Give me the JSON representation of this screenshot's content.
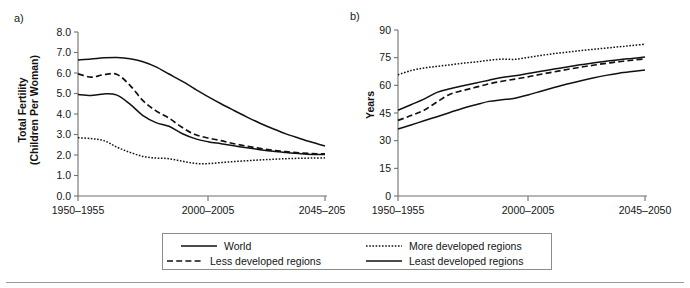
{
  "figure": {
    "background": "#ffffff",
    "line_color": "#111111",
    "axis_color": "#6f6f6f",
    "legend_border_color": "#8c8c8c"
  },
  "panels": {
    "a": {
      "letter": "a)",
      "ylabel_line1": "Total Fertility",
      "ylabel_line2": "(Children Per Woman)"
    },
    "b": {
      "letter": "b)",
      "ylabel": "Years"
    }
  },
  "legend": {
    "position": "below-plots",
    "entries": [
      {
        "label": "World",
        "style": "solid",
        "row": 0,
        "col": 0
      },
      {
        "label": "Less developed regions",
        "style": "dashed",
        "row": 1,
        "col": 0
      },
      {
        "label": "More developed regions",
        "style": "dotted",
        "row": 0,
        "col": 1
      },
      {
        "label": "Least developed regions",
        "style": "solid",
        "row": 1,
        "col": 1
      }
    ]
  },
  "chart_data": [
    {
      "id": "panel-a",
      "type": "line",
      "title": "",
      "panel_letter": "a)",
      "xlabel": "",
      "ylabel": "Total Fertility (Children Per Woman)",
      "ylim": [
        0.0,
        8.0
      ],
      "yticks": [
        0.0,
        1.0,
        2.0,
        3.0,
        4.0,
        5.0,
        6.0,
        7.0,
        8.0
      ],
      "ytick_labels": [
        "0.0",
        "1.0",
        "2.0",
        "3.0",
        "4.0",
        "5.0",
        "6.0",
        "7.0",
        "8.0"
      ],
      "xticks": [
        0,
        10,
        19
      ],
      "xtick_labels": [
        "1950–1955",
        "2000–2005",
        "2045–2050"
      ],
      "x": [
        "1950-1955",
        "1955-1960",
        "1960-1965",
        "1965-1970",
        "1970-1975",
        "1975-1980",
        "1980-1985",
        "1985-1990",
        "1990-1995",
        "1995-2000",
        "2000-2005",
        "2005-2010",
        "2010-2015",
        "2015-2020",
        "2020-2025",
        "2025-2030",
        "2030-2035",
        "2035-2040",
        "2040-2045",
        "2045-2050"
      ],
      "grid": false,
      "legend": "shared",
      "series": [
        {
          "name": "World",
          "style": "solid",
          "values": [
            4.95,
            4.9,
            4.98,
            4.92,
            4.48,
            3.92,
            3.58,
            3.4,
            3.05,
            2.8,
            2.65,
            2.55,
            2.45,
            2.35,
            2.26,
            2.18,
            2.12,
            2.07,
            2.03,
            2.02
          ]
        },
        {
          "name": "Less developed regions",
          "style": "dashed",
          "values": [
            5.96,
            5.8,
            5.92,
            5.93,
            5.4,
            4.65,
            4.15,
            3.8,
            3.35,
            3.0,
            2.83,
            2.7,
            2.55,
            2.43,
            2.32,
            2.23,
            2.16,
            2.1,
            2.07,
            2.05
          ]
        },
        {
          "name": "More developed regions",
          "style": "dotted",
          "values": [
            2.84,
            2.8,
            2.7,
            2.38,
            2.13,
            1.93,
            1.85,
            1.82,
            1.7,
            1.59,
            1.58,
            1.63,
            1.68,
            1.72,
            1.76,
            1.79,
            1.82,
            1.84,
            1.85,
            1.86
          ]
        },
        {
          "name": "Least developed regions",
          "style": "solid",
          "values": [
            6.64,
            6.68,
            6.74,
            6.76,
            6.7,
            6.55,
            6.3,
            5.95,
            5.6,
            5.22,
            4.85,
            4.5,
            4.17,
            3.85,
            3.55,
            3.28,
            3.03,
            2.82,
            2.62,
            2.44
          ]
        }
      ]
    },
    {
      "id": "panel-b",
      "type": "line",
      "title": "",
      "panel_letter": "b)",
      "xlabel": "",
      "ylabel": "Years",
      "ylim": [
        0,
        90
      ],
      "yticks": [
        0,
        15,
        30,
        45,
        60,
        75,
        90
      ],
      "ytick_labels": [
        "0",
        "15",
        "30",
        "45",
        "60",
        "75",
        "90"
      ],
      "xticks": [
        0,
        10,
        19
      ],
      "xtick_labels": [
        "1950–1955",
        "2000–2005",
        "2045–2050"
      ],
      "x": [
        "1950-1955",
        "1955-1960",
        "1960-1965",
        "1965-1970",
        "1970-1975",
        "1975-1980",
        "1980-1985",
        "1985-1990",
        "1990-1995",
        "1995-2000",
        "2000-2005",
        "2005-2010",
        "2010-2015",
        "2015-2020",
        "2020-2025",
        "2025-2030",
        "2030-2035",
        "2035-2040",
        "2040-2045",
        "2045-2050"
      ],
      "grid": false,
      "legend": "shared",
      "series": [
        {
          "name": "World",
          "style": "solid",
          "values": [
            46.5,
            49.5,
            52.5,
            56.2,
            58.2,
            59.8,
            61.3,
            62.8,
            64.2,
            65.2,
            66.4,
            67.6,
            68.8,
            70.0,
            71.1,
            72.1,
            73.0,
            73.9,
            74.6,
            75.3
          ]
        },
        {
          "name": "Less developed regions",
          "style": "dashed",
          "values": [
            41.0,
            43.6,
            46.5,
            51.0,
            55.2,
            57.2,
            59.0,
            60.8,
            62.2,
            63.4,
            64.6,
            66.0,
            67.3,
            68.6,
            69.8,
            70.9,
            71.9,
            72.8,
            73.6,
            74.4
          ]
        },
        {
          "name": "More developed regions",
          "style": "dotted",
          "values": [
            65.7,
            68.0,
            69.4,
            70.3,
            71.1,
            72.0,
            72.7,
            73.6,
            74.2,
            74.1,
            75.1,
            76.2,
            77.2,
            78.0,
            78.8,
            79.5,
            80.2,
            80.9,
            81.6,
            82.3
          ]
        },
        {
          "name": "Least developed regions",
          "style": "solid",
          "values": [
            36.3,
            38.5,
            40.8,
            43.0,
            45.3,
            47.6,
            49.5,
            51.3,
            52.2,
            53.0,
            54.8,
            56.8,
            58.8,
            60.7,
            62.4,
            64.0,
            65.4,
            66.6,
            67.5,
            68.3
          ]
        }
      ]
    }
  ]
}
